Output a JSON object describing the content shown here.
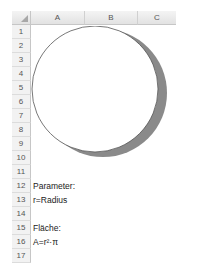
{
  "sheet": {
    "columns": [
      "A",
      "B",
      "C"
    ],
    "rows": [
      "1",
      "2",
      "3",
      "4",
      "5",
      "6",
      "7",
      "8",
      "9",
      "10",
      "11",
      "12",
      "13",
      "14",
      "15",
      "16",
      "17"
    ],
    "cells": {
      "A12": "Parameter:",
      "A13": "r=Radius",
      "A15": "Fläche:",
      "A16": "A=r²·π"
    }
  },
  "shape": {
    "type": "circle",
    "fill": "#ffffff",
    "outline": "#555555",
    "shadow": "#8a8a8a"
  }
}
